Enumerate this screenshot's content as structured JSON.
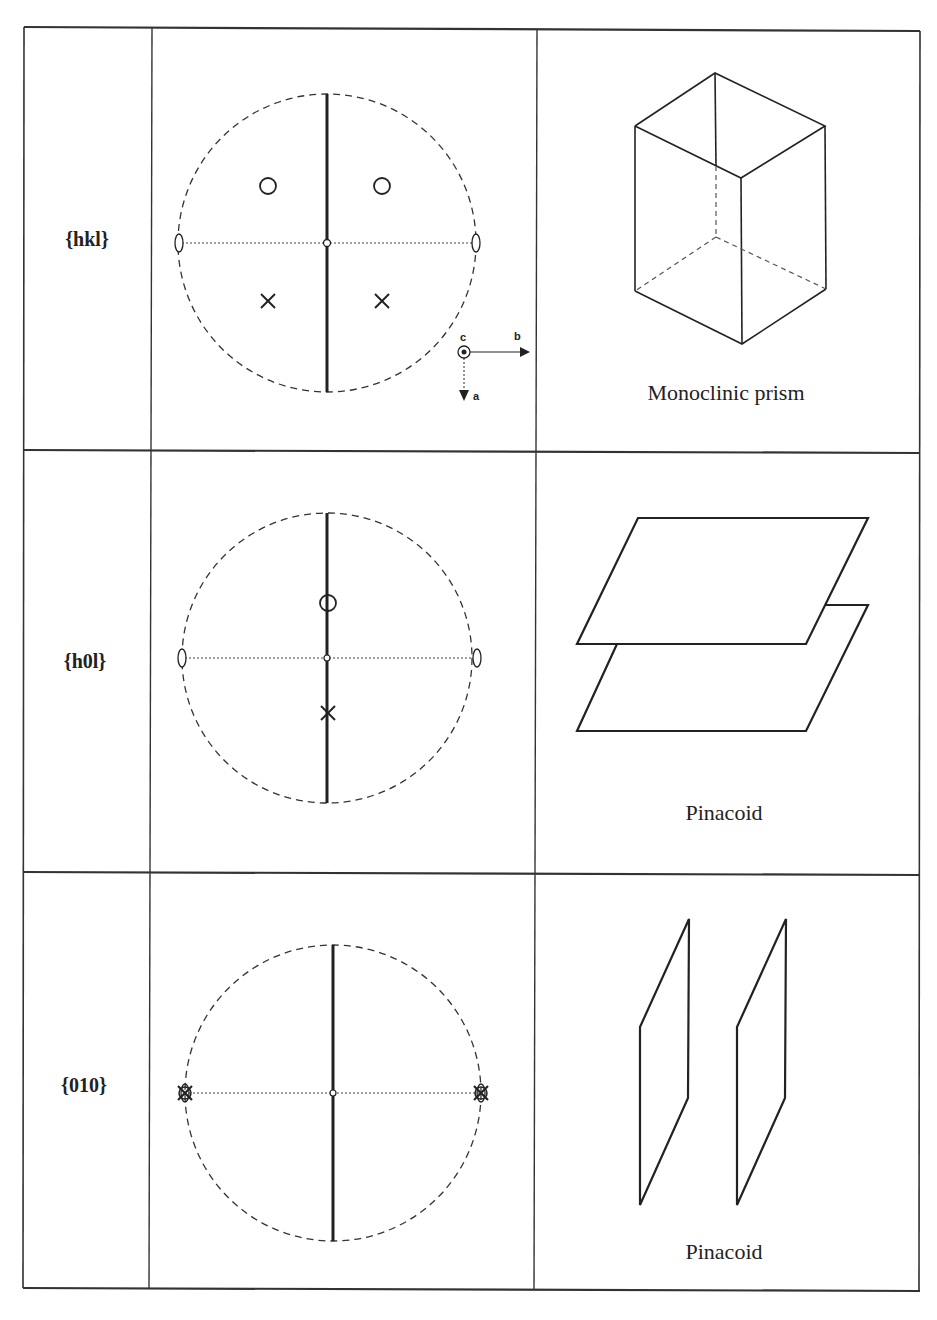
{
  "table": {
    "rows": [
      {
        "form": "{hkl}",
        "shape_name": "Monoclinic prism"
      },
      {
        "form": "{h0l}",
        "shape_name": "Pinacoid"
      },
      {
        "form": "{010}",
        "shape_name": "Pinacoid"
      }
    ]
  },
  "axes_legend": {
    "c": "c",
    "b": "b",
    "a": "a"
  },
  "colors": {
    "line": "#222222",
    "background": "#ffffff"
  }
}
